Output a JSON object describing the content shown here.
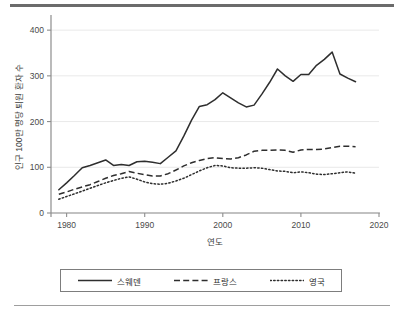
{
  "chart_data": {
    "type": "line",
    "title": "",
    "xlabel": "연도",
    "ylabel": "인구 100만 명당 퇴원 환자 수",
    "xlim": [
      1978,
      2020
    ],
    "ylim": [
      0,
      420
    ],
    "xticks": [
      1980,
      1990,
      2000,
      2010,
      2020
    ],
    "xtick_labels": [
      "1980",
      "1990",
      "2000",
      "2010",
      "2020"
    ],
    "yticks": [
      0,
      100,
      200,
      300,
      400
    ],
    "ytick_labels": [
      "0",
      "100",
      "200",
      "300",
      "400"
    ],
    "grid": "horizontal",
    "legend_position": "bottom",
    "x": [
      1979,
      1980,
      1981,
      1982,
      1983,
      1984,
      1985,
      1986,
      1987,
      1988,
      1989,
      1990,
      1991,
      1992,
      1993,
      1994,
      1995,
      1996,
      1997,
      1998,
      1999,
      2000,
      2001,
      2002,
      2003,
      2004,
      2005,
      2006,
      2007,
      2008,
      2009,
      2010,
      2011,
      2012,
      2013,
      2014,
      2015,
      2016,
      2017
    ],
    "series": [
      {
        "name": "스웨덴",
        "style": "solid",
        "values": [
          51,
          66,
          82,
          99,
          104,
          110,
          116,
          104,
          106,
          104,
          112,
          113,
          111,
          108,
          122,
          136,
          168,
          203,
          233,
          237,
          248,
          263,
          252,
          241,
          232,
          236,
          260,
          286,
          315,
          300,
          288,
          303,
          303,
          323,
          336,
          352,
          304,
          295,
          287
        ]
      },
      {
        "name": "프랑스",
        "style": "dashed",
        "values": [
          41,
          46,
          52,
          57,
          62,
          69,
          76,
          82,
          86,
          91,
          87,
          84,
          81,
          81,
          86,
          94,
          103,
          110,
          115,
          119,
          121,
          119,
          118,
          121,
          127,
          135,
          137,
          137,
          138,
          137,
          133,
          138,
          139,
          139,
          140,
          143,
          146,
          146,
          145
        ]
      },
      {
        "name": "영국",
        "style": "dotted",
        "values": [
          30,
          36,
          42,
          48,
          54,
          60,
          66,
          71,
          76,
          79,
          74,
          68,
          64,
          63,
          65,
          70,
          76,
          84,
          92,
          99,
          104,
          103,
          99,
          98,
          98,
          99,
          98,
          95,
          92,
          91,
          88,
          90,
          88,
          85,
          84,
          86,
          88,
          90,
          87
        ]
      }
    ],
    "legend": [
      {
        "label": "스웨덴",
        "style": "solid"
      },
      {
        "label": "프랑스",
        "style": "dashed"
      },
      {
        "label": "영국",
        "style": "dotted"
      }
    ],
    "colors": {
      "line": "#2e2e2e",
      "grid": "#e9e9e9",
      "axis": "#8d8d8d"
    }
  }
}
